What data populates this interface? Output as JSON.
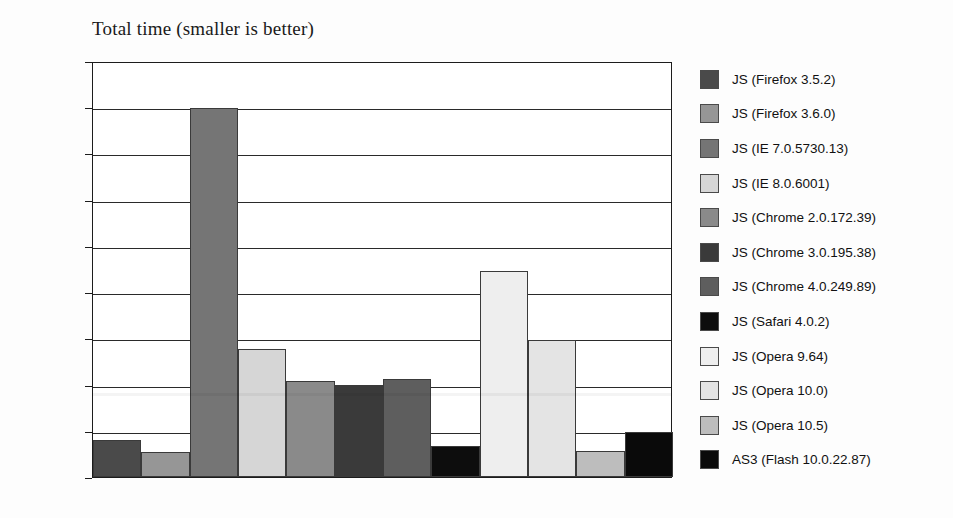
{
  "chart_data": {
    "type": "bar",
    "title": "Total time (smaller is better)",
    "xlabel": "",
    "ylabel": "",
    "ylim": [
      0,
      4500
    ],
    "ytick_step": 500,
    "yticks": [
      0,
      500,
      1000,
      1500,
      2000,
      2500,
      3000,
      3500,
      4000,
      4500
    ],
    "grid": true,
    "legend_position": "right",
    "categories": [
      "JS (Firefox 3.5.2)",
      "JS (Firefox 3.6.0)",
      "JS (IE 7.0.5730.13)",
      "JS (IE 8.0.6001)",
      "JS (Chrome 2.0.172.39)",
      "JS (Chrome 3.0.195.38)",
      "JS (Chrome 4.0.249.89)",
      "JS (Safari 4.0.2)",
      "JS (Opera 9.64)",
      "JS (Opera 10.0)",
      "JS (Opera 10.5)",
      "AS3 (Flash 10.0.22.87)"
    ],
    "values": [
      400,
      270,
      3990,
      1390,
      1040,
      1000,
      1060,
      340,
      2230,
      1480,
      280,
      490
    ],
    "colors": [
      "#4a4a4a",
      "#969696",
      "#757575",
      "#d6d6d6",
      "#8a8a8a",
      "#3a3a3a",
      "#5e5e5e",
      "#0d0d0d",
      "#eeeeee",
      "#e4e4e4",
      "#bdbdbd",
      "#0a0a0a"
    ]
  },
  "legend": {
    "items": [
      {
        "label": "JS (Firefox 3.5.2)",
        "color": "#4a4a4a"
      },
      {
        "label": "JS (Firefox 3.6.0)",
        "color": "#969696"
      },
      {
        "label": "JS (IE 7.0.5730.13)",
        "color": "#757575"
      },
      {
        "label": "JS (IE 8.0.6001)",
        "color": "#d6d6d6"
      },
      {
        "label": "JS (Chrome 2.0.172.39)",
        "color": "#8a8a8a"
      },
      {
        "label": "JS (Chrome 3.0.195.38)",
        "color": "#3a3a3a"
      },
      {
        "label": "JS (Chrome 4.0.249.89)",
        "color": "#5e5e5e"
      },
      {
        "label": "JS (Safari 4.0.2)",
        "color": "#0d0d0d"
      },
      {
        "label": "JS (Opera 9.64)",
        "color": "#eeeeee"
      },
      {
        "label": "JS (Opera 10.0)",
        "color": "#e4e4e4"
      },
      {
        "label": "JS (Opera 10.5)",
        "color": "#bdbdbd"
      },
      {
        "label": "AS3 (Flash 10.0.22.87)",
        "color": "#0a0a0a"
      }
    ]
  }
}
